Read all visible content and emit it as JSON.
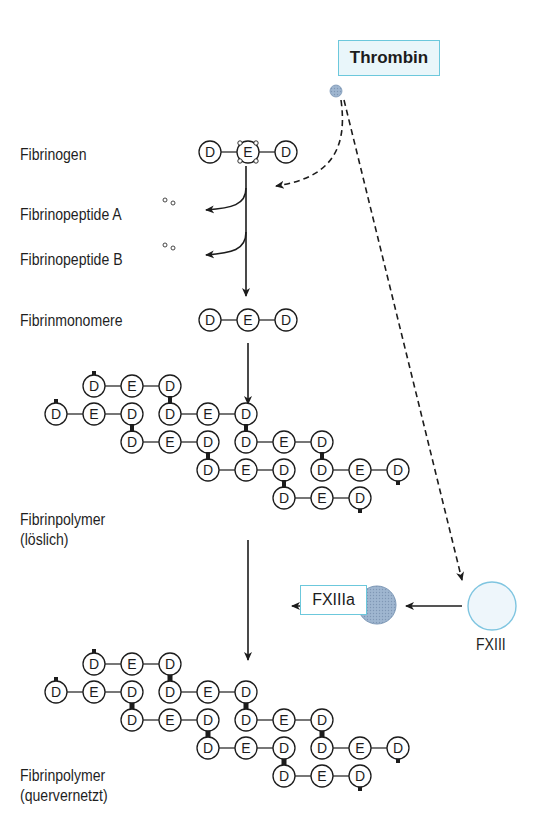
{
  "enzymes": {
    "thrombin": {
      "label": "Thrombin",
      "color": "#8fb0cf",
      "box_color": "#6cc8dc"
    },
    "fxiiia": {
      "label": "FXIIIa",
      "color": "#a7bcd3"
    },
    "fxiii": {
      "label": "FXIII",
      "color": "#eef6fb",
      "stroke": "#7fc5e0"
    }
  },
  "stages": {
    "fibrinogen": "Fibrinogen",
    "fibrinopeptide_a": "Fibrinopeptide A",
    "fibrinopeptide_b": "Fibrinopeptide B",
    "fibrinmonomere": "Fibrinmonomere",
    "fibrinpolymer_soluble_1": "Fibrinpolymer",
    "fibrinpolymer_soluble_2": "(löslich)",
    "fibrinpolymer_crosslinked_1": "Fibrinpolymer",
    "fibrinpolymer_crosslinked_2": "(quervernetzt)"
  },
  "domain_labels": {
    "D": "D",
    "E": "E"
  },
  "monomer_sequence": [
    "D",
    "E",
    "D"
  ],
  "polymer_rows": [
    {
      "x": 94,
      "units": 1
    },
    {
      "x": 56,
      "units": 2
    },
    {
      "x": 132,
      "units": 2
    },
    {
      "x": 208,
      "units": 2
    },
    {
      "x": 284,
      "units": 1
    }
  ],
  "polymer_soluble_y": [
    386,
    414,
    442,
    470,
    498
  ],
  "polymer_crosslinked_y": [
    664,
    692,
    720,
    748,
    776
  ]
}
